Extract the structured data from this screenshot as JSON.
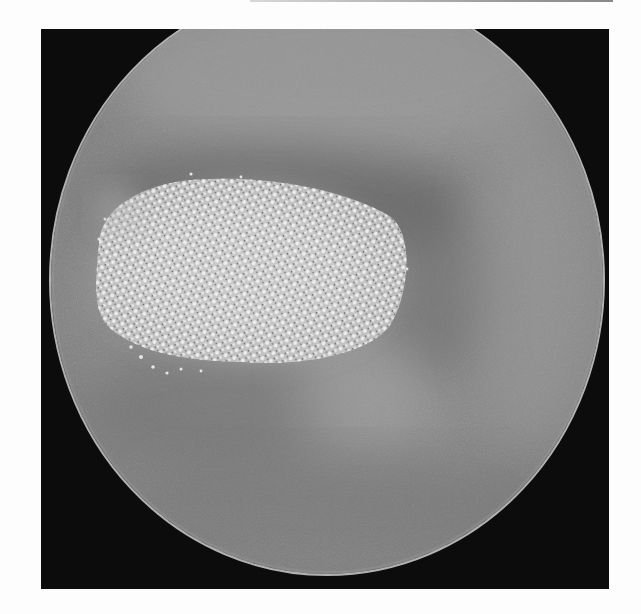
{
  "image": {
    "subject": "circular grayscale endoscopic field with bright granular lesion",
    "frame": {
      "x": 41,
      "y": 29,
      "width": 568,
      "height": 560,
      "color": "#0c0c0c"
    },
    "field": {
      "cx": 286,
      "cy": 251,
      "rx": 278,
      "ry": 296,
      "base_color": "#8d8d8d",
      "rim_color": "#c9c9c9"
    },
    "lesion": {
      "cx": 204,
      "cy": 242,
      "rx": 158,
      "ry": 92,
      "color": "#d9d9d9"
    },
    "shadow_band": {
      "cx": 235,
      "cy": 175,
      "rx": 190,
      "ry": 60,
      "color": "#5a5a5a"
    },
    "colors": {
      "page_background": "#fdfdfd",
      "top_rule": "#9a9a9a"
    }
  }
}
